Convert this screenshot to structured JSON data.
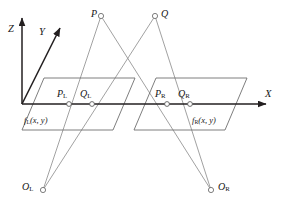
{
  "figure": {
    "background_color": "#ffffff",
    "axis_color": "#231f20",
    "ray_color": "#8e8e8e",
    "plane_color": "#6f6f6f",
    "label_color": "#161616",
    "width": 298,
    "height": 214
  },
  "axes": [
    {
      "id": "z",
      "label": "Z",
      "direction": "up",
      "from": [
        22,
        104
      ],
      "to": [
        22,
        14
      ]
    },
    {
      "id": "y",
      "label": "Y",
      "direction": "up-right",
      "from": [
        22,
        104
      ],
      "to": [
        62,
        24
      ]
    },
    {
      "id": "x",
      "label": "X",
      "direction": "right",
      "from": [
        22,
        104
      ],
      "to": [
        272,
        104
      ]
    }
  ],
  "axis_labels": {
    "z": "Z",
    "y": "Y",
    "x": "X"
  },
  "scene_points": [
    {
      "id": "P",
      "label": "P",
      "label_side": "left",
      "x": 101,
      "y": 16
    },
    {
      "id": "Q",
      "label": "Q",
      "label_side": "right",
      "x": 155,
      "y": 16
    }
  ],
  "camera_centers": [
    {
      "id": "OL",
      "label": "O",
      "sub": "L",
      "label_side": "left",
      "x": 43,
      "y": 190
    },
    {
      "id": "OR",
      "label": "O",
      "sub": "R",
      "label_side": "right",
      "x": 211,
      "y": 190
    }
  ],
  "image_points": [
    {
      "id": "PL",
      "label": "P",
      "sub": "L",
      "x": 69,
      "y": 104,
      "label_side": "above-left"
    },
    {
      "id": "QL",
      "label": "Q",
      "sub": "L",
      "x": 92,
      "y": 104,
      "label_side": "above-left"
    },
    {
      "id": "PR",
      "label": "P",
      "sub": "R",
      "x": 167,
      "y": 104,
      "label_side": "above-left"
    },
    {
      "id": "QR",
      "label": "Q",
      "sub": "R",
      "x": 190,
      "y": 104,
      "label_side": "above-left"
    }
  ],
  "image_planes": [
    {
      "id": "left-plane",
      "function_label": "f",
      "function_sub": "L",
      "function_args": "(x, y)",
      "label_x": 22,
      "label_y": 122,
      "polygon": "44,78 135,78 113,130 22,130"
    },
    {
      "id": "right-plane",
      "function_label": "f",
      "function_sub": "R",
      "function_args": "(x, y)",
      "label_x": 190,
      "label_y": 122,
      "polygon": "156,78 247,78 225,130 134,130"
    }
  ],
  "rays": [
    {
      "id": "ray-OL-P",
      "from": "OL",
      "to": "P",
      "through": "PL"
    },
    {
      "id": "ray-OL-Q",
      "from": "OL",
      "to": "Q",
      "through": "QL"
    },
    {
      "id": "ray-OR-P",
      "from": "OR",
      "to": "P",
      "through": "PR"
    },
    {
      "id": "ray-OR-Q",
      "from": "OR",
      "to": "Q",
      "through": "QR"
    }
  ]
}
